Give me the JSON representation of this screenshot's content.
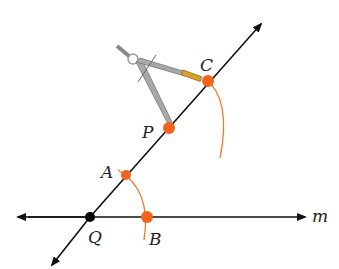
{
  "diagram": {
    "colors": {
      "line": "#111111",
      "arc": "#f07a2a",
      "point": "#f0641e",
      "vertex": "#000000",
      "compass": "#9a9a9a",
      "pencil": "#d9a030"
    },
    "points": {
      "Q": {
        "label": "Q",
        "x": 90,
        "y": 217
      },
      "B": {
        "label": "B",
        "x": 147,
        "y": 217
      },
      "A": {
        "label": "A",
        "x": 126,
        "y": 175
      },
      "P": {
        "label": "P",
        "x": 169,
        "y": 128
      },
      "C": {
        "label": "C",
        "x": 208,
        "y": 81
      }
    },
    "line_label": "m"
  }
}
